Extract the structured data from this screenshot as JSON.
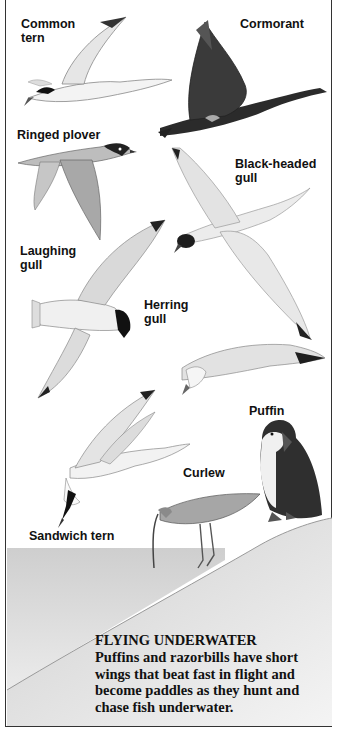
{
  "labels": {
    "common_tern": "Common\ntern",
    "cormorant": "Cormorant",
    "ringed_plover": "Ringed plover",
    "black_headed_gull": "Black-headed\ngull",
    "laughing_gull": "Laughing\ngull",
    "herring_gull": "Herring\ngull",
    "puffin": "Puffin",
    "curlew": "Curlew",
    "sandwich_tern": "Sandwich tern"
  },
  "caption": {
    "title": "FLYING UNDERWATER",
    "body": "Puffins and razorbills have short wings that beat fast in flight and become paddles as they hunt and chase fish underwater."
  },
  "colors": {
    "ink": "#111111",
    "border": "#333333",
    "ground": "#d8d8d8"
  }
}
